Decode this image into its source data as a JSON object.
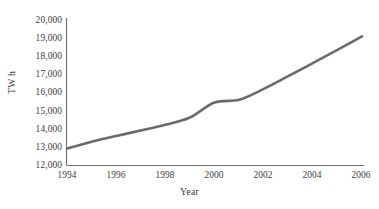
{
  "chart_data": {
    "type": "line",
    "title": "",
    "xlabel": "Year",
    "ylabel": "TW h",
    "x": [
      1994,
      1995,
      1996,
      1997,
      1998,
      1999,
      2000,
      2001,
      2002,
      2003,
      2004,
      2005,
      2006
    ],
    "values": [
      12900,
      13280,
      13600,
      13900,
      14220,
      14620,
      15450,
      15600,
      16200,
      16900,
      17620,
      18350,
      19100
    ],
    "series": [
      {
        "name": "TW h",
        "values": [
          12900,
          13280,
          13600,
          13900,
          14220,
          14620,
          15450,
          15600,
          16200,
          16900,
          17620,
          18350,
          19100
        ]
      }
    ],
    "xlim": [
      1994,
      2006
    ],
    "ylim": [
      12000,
      20000
    ],
    "xticks": [
      1994,
      1996,
      1998,
      2000,
      2002,
      2004,
      2006
    ],
    "xtick_labels": [
      "1994",
      "1996",
      "1998",
      "2000",
      "2002",
      "2004",
      "2006"
    ],
    "yticks": [
      12000,
      13000,
      14000,
      15000,
      16000,
      17000,
      18000,
      19000,
      20000
    ],
    "ytick_labels": [
      "12,000",
      "13,000",
      "14,000",
      "15,000",
      "16,000",
      "17,000",
      "18,000",
      "19,000",
      "20,000"
    ],
    "grid": false,
    "legend": false,
    "legend_position": "none",
    "line_color": "#6b6b6b",
    "axis_color": "#6e6e6e",
    "background_color": "#ffffff",
    "annotations": []
  }
}
